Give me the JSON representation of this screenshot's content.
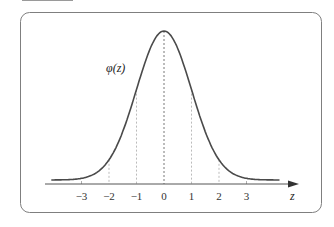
{
  "chart_data": {
    "type": "line",
    "title": "",
    "curve_label": "φ(z)",
    "xlabel": "z",
    "ylabel": "",
    "x_ticks": [
      -3,
      -2,
      -1,
      0,
      1,
      2,
      3
    ],
    "tick_labels": [
      "−3",
      "−2",
      "−1",
      "0",
      "1",
      "2",
      "3"
    ],
    "xlim": [
      -4.1,
      4.8
    ],
    "series": [
      {
        "name": "φ(z)",
        "function": "standard normal density",
        "mean": 0,
        "sd": 1
      }
    ],
    "dashed_guides_at": [
      -2,
      -1,
      0,
      1,
      2
    ],
    "grid": false,
    "legend": "none"
  },
  "colors": {
    "frame": "#7f7f7f",
    "curve": "#4a4a4a",
    "axis": "#555555",
    "guides": "#aaaaaa",
    "center_guide": "#555555"
  }
}
